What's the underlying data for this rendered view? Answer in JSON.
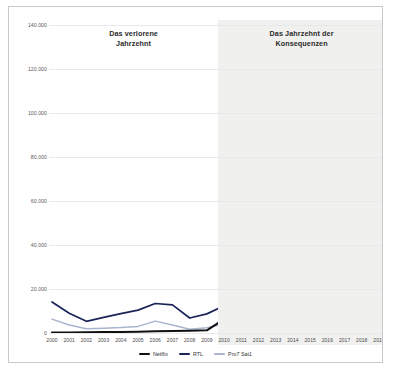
{
  "chart_data": {
    "type": "line",
    "title": "",
    "xlabel": "",
    "ylabel": "",
    "x": [
      2000,
      2001,
      2002,
      2003,
      2004,
      2005,
      2006,
      2007,
      2008,
      2009,
      2010,
      2011,
      2012,
      2013,
      2014,
      2015,
      2016,
      2017,
      2018,
      2019
    ],
    "categories": [
      "2000",
      "2001",
      "2002",
      "2003",
      "2004",
      "2005",
      "2006",
      "2007",
      "2008",
      "2009",
      "2010",
      "2011",
      "2012",
      "2013",
      "2014",
      "2015",
      "2016",
      "2017",
      "2018",
      "2019"
    ],
    "ylim": [
      0,
      140000
    ],
    "yticks": [
      0,
      20000,
      40000,
      60000,
      80000,
      100000,
      120000,
      140000
    ],
    "ytick_labels": [
      "0",
      "20.000",
      "40.000",
      "60.000",
      "80.000",
      "100.000",
      "120.000",
      "140.000"
    ],
    "grid": true,
    "legend_position": "bottom",
    "series": [
      {
        "name": "Netflix",
        "color": "#111111",
        "filled": true,
        "fill_color": "#8c8c8c",
        "values": [
          200,
          250,
          300,
          400,
          500,
          600,
          800,
          900,
          1000,
          1200,
          6300,
          2500,
          3600,
          15500,
          17400,
          46000,
          54000,
          84000,
          99000,
          127000
        ]
      },
      {
        "name": "RTL",
        "color": "#1b2458",
        "filled": false,
        "values": [
          14100,
          9000,
          5300,
          7100,
          8800,
          10400,
          13400,
          12800,
          6800,
          8700,
          12400,
          12800,
          11600,
          15600,
          12900,
          12600,
          12500,
          11200,
          10600,
          7200
        ]
      },
      {
        "name": "Pro7 Sat1",
        "color": "#aab3cf",
        "filled": false,
        "values": [
          6300,
          3600,
          1900,
          2200,
          2500,
          3000,
          5400,
          3600,
          1700,
          2400,
          4100,
          3500,
          3600,
          8800,
          8300,
          10100,
          9400,
          8200,
          5400,
          4800
        ]
      }
    ],
    "annotations": [
      {
        "text_line1": "Das verlorene",
        "text_line2": "Jahrzehnt",
        "span_start": 2000,
        "span_end": 2009
      },
      {
        "text_line1": "Das Jahrzehnt der",
        "text_line2": "Konsequenzen",
        "span_start": 2010,
        "span_end": 2019
      }
    ],
    "shaded_band": {
      "start": 2010,
      "end": 2019,
      "color": "#f0f0ef"
    }
  },
  "legend": {
    "items": [
      {
        "label": "Netflix",
        "color": "#111111"
      },
      {
        "label": "RTL",
        "color": "#1b2458"
      },
      {
        "label": "Pro7 Sat1",
        "color": "#aab3cf"
      }
    ]
  }
}
